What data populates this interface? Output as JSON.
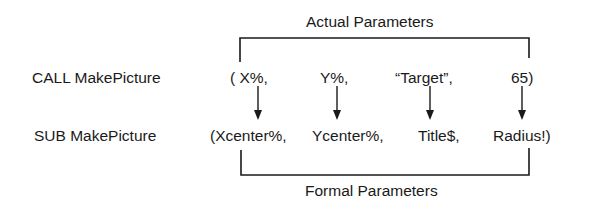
{
  "labels": {
    "actual": "Actual Parameters",
    "formal": "Formal Parameters"
  },
  "call_row": {
    "keyword": "CALL MakePicture",
    "args": [
      "( X%,",
      "Y%,",
      "“Target”,",
      "65)"
    ]
  },
  "sub_row": {
    "keyword": "SUB MakePicture",
    "params": [
      "(Xcenter%,",
      "Ycenter%,",
      "Title$,",
      "Radius!)"
    ]
  },
  "mappings": [
    {
      "from": "X%",
      "to": "Xcenter%"
    },
    {
      "from": "Y%",
      "to": "Ycenter%"
    },
    {
      "from": "“Target”",
      "to": "Title$"
    },
    {
      "from": "65",
      "to": "Radius!"
    }
  ],
  "colors": {
    "ink": "#1a1a1a",
    "background": "#ffffff"
  }
}
